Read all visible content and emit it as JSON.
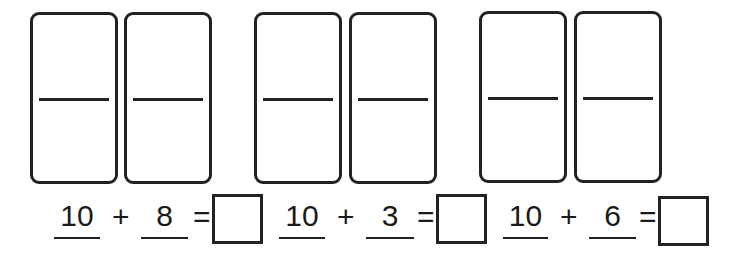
{
  "worksheet": {
    "problems": [
      {
        "dominoes": [
          {
            "top": "",
            "bottom": ""
          },
          {
            "top": "",
            "bottom": ""
          }
        ],
        "addend1": "10",
        "operator": "+",
        "addend2": "8",
        "equals": "=",
        "answer": ""
      },
      {
        "dominoes": [
          {
            "top": "",
            "bottom": ""
          },
          {
            "top": "",
            "bottom": ""
          }
        ],
        "addend1": "10",
        "operator": "+",
        "addend2": "3",
        "equals": "=",
        "answer": ""
      },
      {
        "dominoes": [
          {
            "top": "",
            "bottom": ""
          },
          {
            "top": "",
            "bottom": ""
          }
        ],
        "addend1": "10",
        "operator": "+",
        "addend2": "6",
        "equals": "=",
        "answer": ""
      }
    ]
  }
}
